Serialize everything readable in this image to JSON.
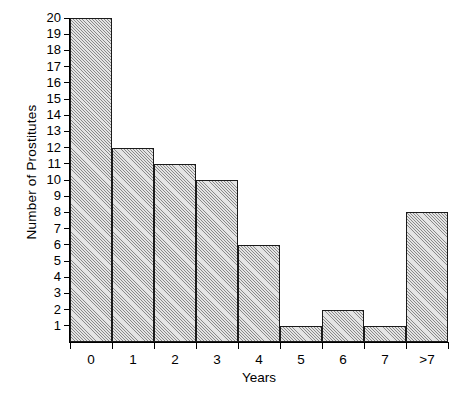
{
  "chart_data": {
    "type": "bar",
    "title": "",
    "xlabel": "Years",
    "ylabel": "Number of Prostitutes",
    "categories": [
      "0",
      "1",
      "2",
      "3",
      "4",
      "5",
      "6",
      "7",
      ">7"
    ],
    "values": [
      20,
      12,
      11,
      10,
      6,
      1,
      2,
      1,
      8
    ],
    "ylim": [
      0,
      20
    ],
    "yticks": [
      1,
      2,
      3,
      4,
      5,
      6,
      7,
      8,
      9,
      10,
      11,
      12,
      13,
      14,
      15,
      16,
      17,
      18,
      19,
      20
    ],
    "ytick_labels": [
      "1",
      "2",
      "3",
      "4",
      "5",
      "6",
      "7",
      "8",
      "9",
      "10",
      "11",
      "12",
      "13",
      "14",
      "15",
      "16",
      "17",
      "18",
      "19",
      "20"
    ],
    "grid": false,
    "legend": null,
    "bar_style": {
      "fill": "#e4e4e4",
      "pattern": "diagonal-hatch",
      "edge_color": "#1a1a1a"
    },
    "background_color": "#ffffff"
  }
}
